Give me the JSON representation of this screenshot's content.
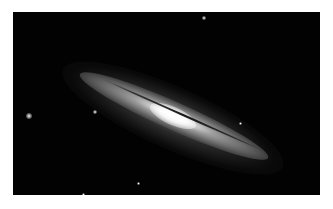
{
  "image": {
    "subject": "edge-on spiral galaxy with dust lane",
    "background_color": "#020202",
    "border_color": "#ffffff"
  },
  "stars": [
    {
      "x": 13,
      "y": 101,
      "size": 6
    },
    {
      "x": 80,
      "y": 98,
      "size": 4
    },
    {
      "x": 189,
      "y": 4,
      "size": 4
    },
    {
      "x": 124,
      "y": 170,
      "size": 3
    },
    {
      "x": 69,
      "y": 181,
      "size": 3
    },
    {
      "x": 226,
      "y": 110,
      "size": 3
    }
  ]
}
